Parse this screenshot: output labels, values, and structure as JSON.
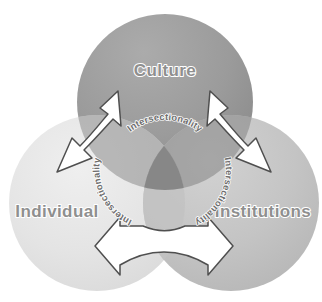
{
  "diagram": {
    "type": "venn-three-circle",
    "width": 322,
    "height": 302,
    "background_color": "#ffffff",
    "circles": [
      {
        "id": "culture",
        "label": "Culture",
        "position": "top",
        "fill_color": "#9a9a9a",
        "gradient_light": "#a8a8a8",
        "gradient_dark": "#8a8a8a",
        "cx": 165,
        "cy": 102,
        "r": 88
      },
      {
        "id": "individual",
        "label": "Individual",
        "position": "bottom-left",
        "fill_color": "#e2e2e2",
        "gradient_light": "#eeeeee",
        "gradient_dark": "#d8d8d8",
        "cx": 97,
        "cy": 203,
        "r": 88
      },
      {
        "id": "institutions",
        "label": "Institutions",
        "position": "bottom-right",
        "fill_color": "#c4c4c4",
        "gradient_light": "#d0d0d0",
        "gradient_dark": "#b8b8b8",
        "cx": 231,
        "cy": 203,
        "r": 88
      }
    ],
    "overlap_center_color": "#7c7c7c",
    "label_text_color": "#8f8f8f",
    "label_outline_color": "#ffffff",
    "intersection_labels": [
      {
        "id": "intersectionality-top",
        "text": "Intersectionality",
        "between": "Culture and center",
        "orientation": "arc-top"
      },
      {
        "id": "intersectionality-left",
        "text": "Intersectionality",
        "between": "Individual and center",
        "orientation": "arc-left"
      },
      {
        "id": "intersectionality-right",
        "text": "Intersectionality",
        "between": "Institutions and center",
        "orientation": "arc-right"
      }
    ],
    "arrows": [
      {
        "id": "arrow-culture-individual",
        "direction": "bidirectional",
        "angle": "diagonal-up-right-down-left",
        "fill_color": "#ffffff",
        "stroke_color": "#555555"
      },
      {
        "id": "arrow-culture-institutions",
        "direction": "bidirectional",
        "angle": "diagonal-up-left-down-right",
        "fill_color": "#ffffff",
        "stroke_color": "#555555"
      },
      {
        "id": "arrow-individual-institutions",
        "direction": "bidirectional",
        "angle": "horizontal",
        "fill_color": "#ffffff",
        "stroke_color": "#555555"
      }
    ]
  }
}
